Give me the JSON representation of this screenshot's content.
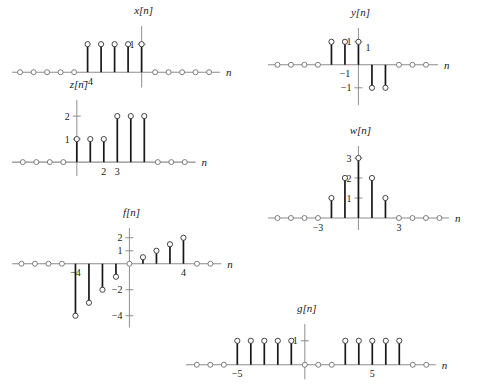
{
  "page": {
    "background": "#ffffff",
    "stem_color": "#171717",
    "axis_color": "#8d8d8d",
    "marker_fill": "#ffffff"
  },
  "axis_name": "n",
  "chart_data": [
    {
      "id": "x",
      "type": "scatter",
      "title": "x[n]",
      "xlabel": "n",
      "ylabel": "x[n]",
      "grid": false,
      "legend": null,
      "x": [
        -9,
        -8,
        -7,
        -6,
        -5,
        -4,
        -3,
        -2,
        -1,
        0,
        1,
        2,
        3,
        4,
        5
      ],
      "values": [
        0,
        0,
        0,
        0,
        0,
        1,
        1,
        1,
        1,
        1,
        0,
        0,
        0,
        0,
        0
      ],
      "xticks": [
        {
          "x": -4,
          "label": "-4"
        }
      ],
      "yticks": [
        {
          "y": 1,
          "label": "1"
        }
      ],
      "xlim": [
        -9.6,
        5.8
      ],
      "ylim": [
        -0.55,
        1.65
      ]
    },
    {
      "id": "y",
      "type": "scatter",
      "title": "y[n]",
      "xlabel": "n",
      "ylabel": "y[n]",
      "grid": false,
      "legend": null,
      "x": [
        -6,
        -5,
        -4,
        -3,
        -2,
        -1,
        0,
        1,
        2,
        3,
        4,
        5
      ],
      "values": [
        0,
        0,
        0,
        0,
        1,
        1,
        1,
        -1,
        -1,
        0,
        0,
        0
      ],
      "xticks": [
        {
          "x": -1,
          "label": "-1"
        }
      ],
      "yticks": [
        {
          "y": 1,
          "label": "1"
        },
        {
          "y": -1,
          "label": "-1"
        }
      ],
      "annotations": [
        {
          "text": "1",
          "x": 1,
          "y": 0.62
        }
      ],
      "xlim": [
        -6.7,
        5.9
      ],
      "ylim": [
        -1.75,
        1.6
      ]
    },
    {
      "id": "z",
      "type": "scatter",
      "title": "z[n]",
      "xlabel": "n",
      "ylabel": "z[n]",
      "grid": false,
      "legend": null,
      "x": [
        -4,
        -3,
        -2,
        -1,
        0,
        1,
        2,
        3,
        4,
        5,
        6,
        7,
        8
      ],
      "values": [
        0,
        0,
        0,
        0,
        1,
        1,
        1,
        2,
        2,
        2,
        0,
        0,
        0
      ],
      "xticks": [
        {
          "x": 2,
          "label": "2"
        },
        {
          "x": 3,
          "label": "3"
        }
      ],
      "yticks": [
        {
          "y": 1,
          "label": "1"
        },
        {
          "y": 2,
          "label": "2"
        }
      ],
      "xlim": [
        -4.8,
        8.8
      ],
      "ylim": [
        -0.6,
        2.7
      ]
    },
    {
      "id": "w",
      "type": "scatter",
      "title": "w[n]",
      "xlabel": "n",
      "ylabel": "w[n]",
      "grid": false,
      "legend": null,
      "x": [
        -6,
        -5,
        -4,
        -3,
        -2,
        -1,
        0,
        1,
        2,
        3,
        4,
        5,
        6
      ],
      "values": [
        0,
        0,
        0,
        0,
        1,
        2,
        3,
        2,
        1,
        0,
        0,
        0,
        0
      ],
      "xticks": [
        {
          "x": -3,
          "label": "-3"
        },
        {
          "x": 3,
          "label": "3"
        }
      ],
      "yticks": [
        {
          "y": 1,
          "label": "1"
        },
        {
          "y": 2,
          "label": "2"
        },
        {
          "y": 3,
          "label": "3"
        }
      ],
      "xlim": [
        -6.7,
        6.7
      ],
      "ylim": [
        -0.6,
        3.6
      ]
    },
    {
      "id": "f",
      "type": "scatter",
      "title": "f[n]",
      "xlabel": "n",
      "ylabel": "f[n]",
      "grid": false,
      "legend": null,
      "x": [
        -8,
        -7,
        -6,
        -5,
        -4,
        -3,
        -2,
        -1,
        0,
        1,
        2,
        3,
        4,
        5,
        6
      ],
      "values": [
        0,
        0,
        0,
        0,
        -4,
        -3,
        -2,
        -1,
        0,
        0.5,
        1,
        1.5,
        2,
        0,
        0
      ],
      "xticks": [
        {
          "x": -4,
          "label": "-4"
        },
        {
          "x": 4,
          "label": "4"
        }
      ],
      "yticks": [
        {
          "y": 2,
          "label": "2"
        },
        {
          "y": 1,
          "label": "1"
        },
        {
          "y": -2,
          "label": "-2"
        },
        {
          "y": -4,
          "label": "-4"
        }
      ],
      "xlim": [
        -8.7,
        6.8
      ],
      "ylim": [
        -4.9,
        2.75
      ]
    },
    {
      "id": "g",
      "type": "scatter",
      "title": "g[n]",
      "xlabel": "n",
      "ylabel": "g[n]",
      "grid": false,
      "legend": null,
      "x": [
        -8,
        -7,
        -6,
        -5,
        -4,
        -3,
        -2,
        -1,
        0,
        1,
        2,
        3,
        4,
        5,
        6,
        7,
        8,
        9
      ],
      "values": [
        0,
        0,
        0,
        1,
        1,
        1,
        1,
        1,
        0,
        0,
        0,
        1,
        1,
        1,
        1,
        1,
        0,
        0
      ],
      "xticks": [
        {
          "x": -5,
          "label": "-5"
        },
        {
          "x": 5,
          "label": "5"
        }
      ],
      "yticks": [
        {
          "y": 1,
          "label": "1"
        }
      ],
      "xlim": [
        -8.8,
        9.7
      ],
      "ylim": [
        -0.6,
        1.7
      ]
    }
  ]
}
